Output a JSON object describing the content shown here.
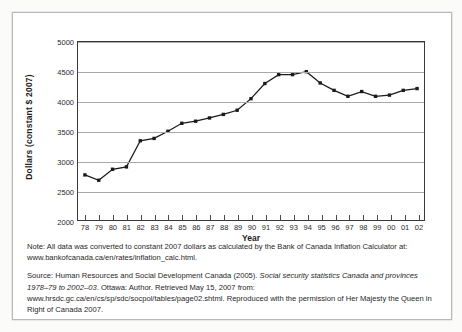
{
  "figure": {
    "ylabel": "Dollars (constant $ 2007)",
    "xlabel": "Year"
  },
  "chart_data": {
    "type": "line",
    "title": "",
    "xlabel": "Year",
    "ylabel": "Dollars (constant $ 2007)",
    "ylim": [
      2000,
      5000
    ],
    "ytick_labels": [
      "2000",
      "2500",
      "3000",
      "3500",
      "4000",
      "4500",
      "5000"
    ],
    "yticks": [
      2000,
      2500,
      3000,
      3500,
      4000,
      4500,
      5000
    ],
    "grid": "horizontal",
    "legend": "none",
    "marker": "filled-square",
    "line_color": "#1a1a1a",
    "categories": [
      "78",
      "79",
      "80",
      "81",
      "82",
      "83",
      "84",
      "85",
      "86",
      "87",
      "88",
      "89",
      "90",
      "91",
      "92",
      "93",
      "94",
      "95",
      "96",
      "97",
      "98",
      "99",
      "00",
      "01",
      "02"
    ],
    "values": [
      2760,
      2670,
      2855,
      2895,
      3335,
      3375,
      3495,
      3630,
      3665,
      3720,
      3780,
      3850,
      4045,
      4300,
      4450,
      4450,
      4500,
      4310,
      4185,
      4085,
      4165,
      4085,
      4105,
      4185,
      4215
    ]
  },
  "caption": {
    "note_line1": "Note: All data was converted to constant 2007 dollars as calculated by the Bank of Canada Inflation Calculator",
    "note_line2": "at: www.bankofcanada.ca/en/rates/inflation_calc.html.",
    "source_part1": "Source: Human Resources and Social Development Canada (2005). ",
    "source_italic": "Social security statistics Canada and provinces 1978–79 to 2002–03",
    "source_part2": ". Ottawa: Author. Retrieved May 15, 2007 from: www.hrsdc.gc.ca/en/cs/sp/sdc/socpol/tables/page02.shtml. Reproduced with the permission of Her Majesty the Queen in Right of Canada 2007."
  }
}
